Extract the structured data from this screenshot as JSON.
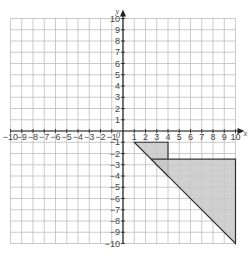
{
  "chart_data": {
    "type": "diagram",
    "title": "",
    "xlabel": "x",
    "ylabel": "y",
    "xlim": [
      -10,
      10
    ],
    "ylim": [
      -10,
      10
    ],
    "grid": true,
    "origin_label": "0",
    "x_ticks": [
      -10,
      -9,
      -8,
      -7,
      -6,
      -5,
      -4,
      -3,
      -2,
      -1,
      1,
      2,
      3,
      4,
      5,
      6,
      7,
      8,
      9,
      10
    ],
    "y_ticks": [
      10,
      9,
      8,
      7,
      6,
      5,
      4,
      3,
      2,
      1,
      -1,
      -2,
      -3,
      -4,
      -5,
      -6,
      -7,
      -8,
      -9,
      -10
    ],
    "shapes": [
      {
        "name": "small-triangle",
        "vertices": [
          [
            1,
            -1
          ],
          [
            4,
            -1
          ],
          [
            4,
            -4
          ]
        ],
        "fill": "#c8c8c8",
        "stroke": "#333333"
      },
      {
        "name": "large-triangle",
        "vertices": [
          [
            2.5,
            -2.5
          ],
          [
            10,
            -2.5
          ],
          [
            10,
            -10
          ]
        ],
        "fill": "#c8c8c8",
        "stroke": "#333333"
      }
    ]
  },
  "colors": {
    "grid": "#bdbdbd",
    "axis": "#222222",
    "shape_fill": "#c8c8c8",
    "shape_stroke": "#333333"
  }
}
